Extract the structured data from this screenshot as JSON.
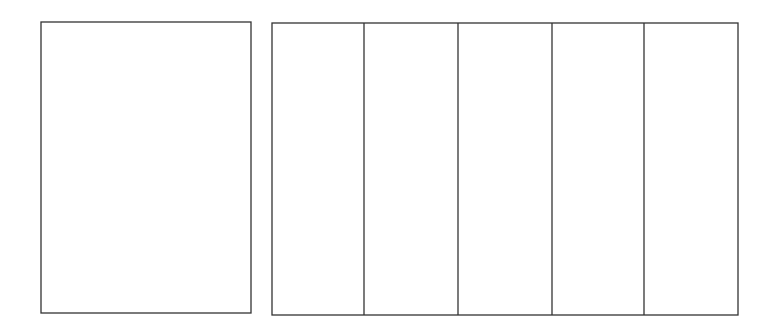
{
  "diagram": {
    "stroke_color": "#333333",
    "background": "#ffffff",
    "left_shape": {
      "label": "",
      "x": 41,
      "y": 22,
      "w": 210,
      "h": 291
    },
    "right_shape": {
      "label": "",
      "x": 272,
      "y": 23,
      "w": 466,
      "h": 292,
      "divisions": 5,
      "divider_x": [
        364,
        458,
        552,
        644
      ]
    }
  }
}
